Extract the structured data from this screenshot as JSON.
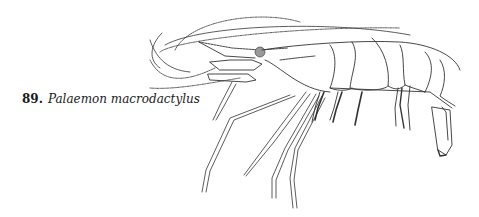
{
  "figure": {
    "number": "89.",
    "species": "Palaemon macrodactylus",
    "illustration": "shrimp-line-drawing",
    "colors": {
      "ink": "#333333",
      "background": "#ffffff",
      "caption": "#1a1a1a"
    }
  }
}
